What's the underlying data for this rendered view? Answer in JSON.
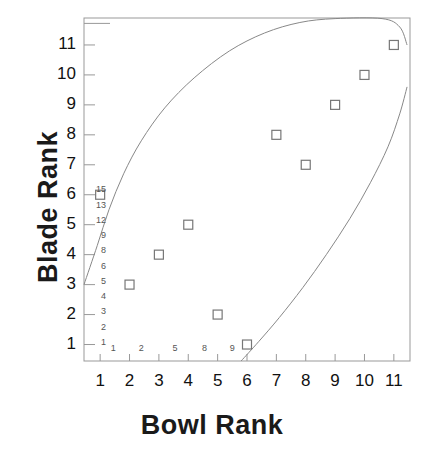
{
  "chart_data": {
    "type": "scatter",
    "title": "",
    "xlabel": "Bowl Rank",
    "ylabel": "Blade Rank",
    "xlim": [
      0.45,
      11.55
    ],
    "ylim": [
      0.45,
      11.9
    ],
    "grid": false,
    "legend": "none",
    "x_ticks": [
      "1",
      "2",
      "3",
      "4",
      "5",
      "6",
      "7",
      "8",
      "9",
      "10",
      "11"
    ],
    "y_ticks": [
      "1",
      "2",
      "3",
      "4",
      "5",
      "6",
      "7",
      "8",
      "9",
      "10",
      "11"
    ],
    "x_tick_values": [
      1,
      2,
      3,
      4,
      5,
      6,
      7,
      8,
      9,
      10,
      11
    ],
    "y_tick_values": [
      1,
      2,
      3,
      4,
      5,
      6,
      7,
      8,
      9,
      10,
      11
    ],
    "marker": "open-square",
    "marker_color": "#777777",
    "points": [
      {
        "x": 1,
        "y": 6
      },
      {
        "x": 2,
        "y": 3
      },
      {
        "x": 3,
        "y": 4
      },
      {
        "x": 4,
        "y": 5
      },
      {
        "x": 5,
        "y": 2
      },
      {
        "x": 6,
        "y": 1
      },
      {
        "x": 7,
        "y": 8
      },
      {
        "x": 8,
        "y": 7
      },
      {
        "x": 9,
        "y": 9
      },
      {
        "x": 10,
        "y": 10
      },
      {
        "x": 11,
        "y": 11
      }
    ],
    "x": [
      1,
      2,
      3,
      4,
      5,
      6,
      7,
      8,
      9,
      10,
      11
    ],
    "y": [
      6,
      3,
      4,
      5,
      2,
      1,
      8,
      7,
      9,
      10,
      11
    ],
    "inner_y_annotations": [
      "15",
      "13",
      "12",
      "9",
      "8",
      "6",
      "5",
      "4",
      "3",
      "2",
      "1"
    ],
    "inner_x_annotations": [
      "1",
      "2",
      "5",
      "8",
      "9"
    ],
    "curves": [
      {
        "name": "upper-confidence-bound",
        "color": "#888888",
        "points": [
          {
            "x": 0.45,
            "y": 3.0
          },
          {
            "x": 0.9,
            "y": 4.3
          },
          {
            "x": 1.3,
            "y": 5.5
          },
          {
            "x": 1.8,
            "y": 6.7
          },
          {
            "x": 2.4,
            "y": 7.8
          },
          {
            "x": 3.2,
            "y": 8.9
          },
          {
            "x": 4.2,
            "y": 9.9
          },
          {
            "x": 5.4,
            "y": 10.8
          },
          {
            "x": 6.6,
            "y": 11.4
          },
          {
            "x": 7.8,
            "y": 11.75
          },
          {
            "x": 9.0,
            "y": 11.88
          },
          {
            "x": 10.6,
            "y": 11.88
          },
          {
            "x": 11.2,
            "y": 11.6
          },
          {
            "x": 11.45,
            "y": 11.0
          }
        ]
      },
      {
        "name": "lower-confidence-bound",
        "color": "#888888",
        "points": [
          {
            "x": 5.8,
            "y": 0.45
          },
          {
            "x": 6.4,
            "y": 1.1
          },
          {
            "x": 7.1,
            "y": 1.9
          },
          {
            "x": 7.9,
            "y": 2.9
          },
          {
            "x": 8.7,
            "y": 4.0
          },
          {
            "x": 9.5,
            "y": 5.2
          },
          {
            "x": 10.2,
            "y": 6.4
          },
          {
            "x": 10.8,
            "y": 7.6
          },
          {
            "x": 11.2,
            "y": 8.7
          },
          {
            "x": 11.45,
            "y": 9.6
          }
        ]
      }
    ],
    "frame": {
      "left_axis": true,
      "bottom_axis": true,
      "top_axis": true,
      "right_axis": true,
      "color": "#999999"
    }
  }
}
